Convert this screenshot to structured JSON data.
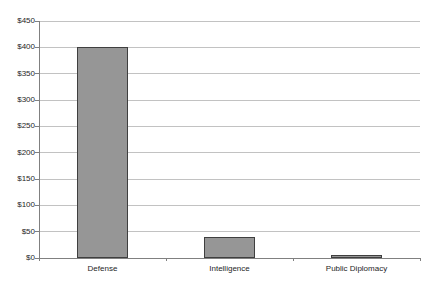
{
  "chart_data": {
    "type": "bar",
    "title": "",
    "xlabel": "",
    "ylabel": "",
    "categories": [
      "Defense",
      "Intelligence",
      "Public Diplomacy"
    ],
    "values": [
      400,
      40,
      2
    ],
    "ylim": [
      0,
      450
    ],
    "ytick_step": 50,
    "ytick_labels": [
      "$450",
      "$400",
      "$350",
      "$300",
      "$250",
      "$200",
      "$150",
      "$100",
      "$50",
      "$0"
    ],
    "grid": true,
    "legend": false
  },
  "colors": {
    "background": "#ffffff",
    "bar_fill": "#969696",
    "bar_border": "#3f3f3f",
    "gridline": "#c2c2c2",
    "axis": "#808080",
    "text": "#262626"
  }
}
